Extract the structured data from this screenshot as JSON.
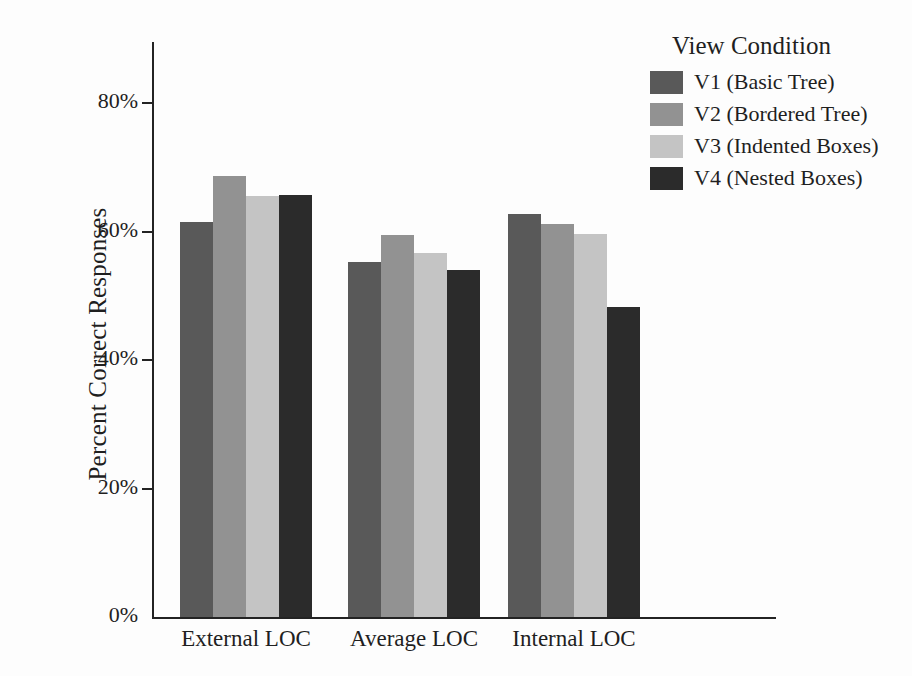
{
  "chart_data": {
    "type": "bar",
    "title": "",
    "xlabel": "",
    "ylabel": "Percent Correct Responses",
    "categories": [
      "External LOC",
      "Average LOC",
      "Internal LOC"
    ],
    "ylim": [
      0,
      0.9
    ],
    "y_ticks": [
      "0%",
      "20%",
      "40%",
      "60%",
      "80%"
    ],
    "y_tick_values": [
      0,
      20,
      40,
      60,
      80
    ],
    "grid": false,
    "legend_position": "top-right",
    "legend_title": "View Condition",
    "series": [
      {
        "name": "V1 (Basic Tree)",
        "color": "#595959",
        "values": [
          61.5,
          55.2,
          62.8
        ]
      },
      {
        "name": "V2 (Bordered Tree)",
        "color": "#929292",
        "values": [
          68.6,
          59.4,
          61.2
        ]
      },
      {
        "name": "V3 (Indented Boxes)",
        "color": "#c4c4c4",
        "values": [
          65.6,
          56.7,
          59.6
        ]
      },
      {
        "name": "V4 (Nested Boxes)",
        "color": "#2b2b2b",
        "values": [
          65.7,
          54.0,
          48.3
        ]
      }
    ]
  }
}
